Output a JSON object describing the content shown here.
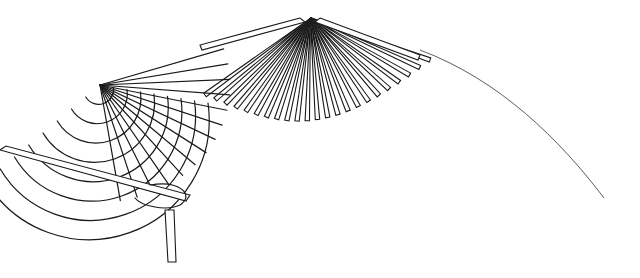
{
  "illustration": {
    "subject": "basketry technique line drawing",
    "parts": [
      {
        "name": "woven-fan",
        "description": "plaited/woven fan section on the left"
      },
      {
        "name": "spoke-fan",
        "description": "radiating spokes fan in the middle"
      },
      {
        "name": "stitched-edge",
        "description": "hatched stitch beads along the fan rims"
      },
      {
        "name": "bead-arc",
        "description": "dangling arc of hatched stitches on the right"
      },
      {
        "name": "thread",
        "description": "thin thread line from top to right end"
      },
      {
        "name": "needle-strand",
        "description": "flat strand with loop at the bottom left"
      }
    ],
    "colors": {
      "line": "#1a1a1a",
      "background": "#ffffff",
      "hatch": "#888888"
    }
  }
}
